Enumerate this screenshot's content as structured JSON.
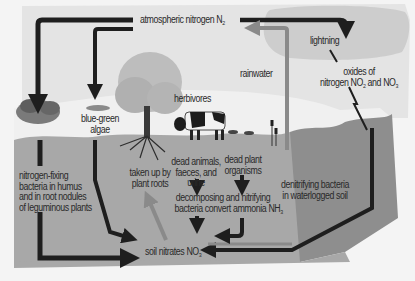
{
  "diagram": {
    "labels": {
      "atmospheric_nitrogen": "atmospheric nitrogen N",
      "atmospheric_nitrogen_sub": "2",
      "lightning": "lightning",
      "oxides_line1": "oxides of",
      "oxides_line2a": "nitrogen NO",
      "oxides_sub1": "2",
      "oxides_line2b": " and NO",
      "oxides_sub2": "3",
      "rainwater": "rainwater",
      "herbivores": "herbivores",
      "blue_green_1": "blue-green",
      "blue_green_2": "algae",
      "taken_up_1": "taken up by",
      "taken_up_2": "plant roots",
      "dead_animals_1": "dead animals,",
      "dead_animals_2": "faeces, and",
      "dead_animals_3": "urine",
      "dead_plant_1": "dead plant",
      "dead_plant_2": "organisms",
      "nitrogen_fixing_1": "nitrogen-fixing",
      "nitrogen_fixing_2": "bacteria in humus",
      "nitrogen_fixing_3": "and in root nodules",
      "nitrogen_fixing_4": "of leguminous plants",
      "decomposing_1": "decomposing and nitrifying",
      "decomposing_2": "bacteria convert ammonia NH",
      "decomposing_sub": "3",
      "denitrifying_1": "denitrifying bacteria",
      "denitrifying_2": "in waterlogged soil",
      "soil_nitrates": "soil nitrates NO",
      "soil_nitrates_sub": "3"
    },
    "colors": {
      "sky": "#e2e2e2",
      "cloud": "#cfcfcf",
      "soil": "#a6a6a6",
      "soil_side": "#8f8f8f",
      "arrow_dark": "#1e1e1e",
      "arrow_grey": "#8a8a8a"
    }
  }
}
